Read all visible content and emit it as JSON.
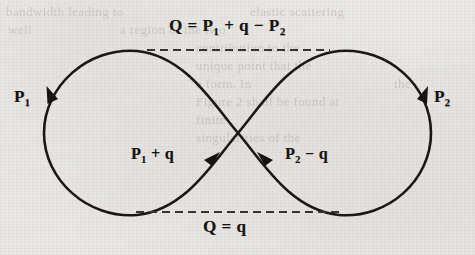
{
  "figure": {
    "kind": "figure-eight-momentum-diagram",
    "paper_color": "#edebe8",
    "ink_color": "#17130f",
    "dash_color": "#3a332c",
    "labels": {
      "top_equation": {
        "lead": "Q = P",
        "sub1": "1",
        "mid": " + q − P",
        "sub2": "2"
      },
      "bottom_equation": {
        "text": "Q = q"
      },
      "left_momentum": {
        "lead": "P",
        "sub": "1"
      },
      "right_momentum": {
        "lead": "P",
        "sub": "2"
      },
      "inner_left": {
        "lead": "P",
        "sub": "1",
        "tail": " + q"
      },
      "inner_right": {
        "lead": "P",
        "sub": "2",
        "tail": " − q"
      }
    },
    "ghost_text": [
      {
        "text": "bandwidth leading to",
        "x": 6,
        "y": 4
      },
      {
        "text": "elastic scattering",
        "x": 250,
        "y": 4
      },
      {
        "text": "well",
        "x": 8,
        "y": 22
      },
      {
        "text": "a region of the two",
        "x": 120,
        "y": 22
      },
      {
        "text": "contribution to the",
        "x": 196,
        "y": 40
      },
      {
        "text": "unique point that the",
        "x": 196,
        "y": 58
      },
      {
        "text": "a form. In",
        "x": 196,
        "y": 76
      },
      {
        "text": "the",
        "x": 394,
        "y": 76
      },
      {
        "text": "Figure 2 shall be found at",
        "x": 196,
        "y": 94
      },
      {
        "text": "finite",
        "x": 196,
        "y": 112
      },
      {
        "text": "singularities of the",
        "x": 196,
        "y": 130
      }
    ]
  },
  "chart_data": {
    "type": "diagram",
    "crossing_point": {
      "x": 238,
      "y": 133
    },
    "left_lobe": {
      "cx": 137,
      "cy": 133,
      "rx": 93,
      "ry": 83
    },
    "right_lobe": {
      "cx": 338,
      "cy": 133,
      "rx": 93,
      "ry": 83
    },
    "dashed_lines": [
      {
        "name": "top-cut",
        "x1": 147,
        "x2": 330,
        "y": 50,
        "label": "Q = P1 + q − P2"
      },
      {
        "name": "bottom-cut",
        "x1": 136,
        "x2": 344,
        "y": 212,
        "label": "Q = q"
      }
    ],
    "arrowheads": [
      {
        "name": "p1-arrow",
        "x": 51,
        "y": 97,
        "direction": "down",
        "label": "P1"
      },
      {
        "name": "p2-arrow",
        "x": 424,
        "y": 97,
        "direction": "down",
        "label": "P2"
      },
      {
        "name": "p1q-arrow",
        "x": 212,
        "y": 160,
        "direction": "up-right",
        "label": "P1 + q"
      },
      {
        "name": "p2q-arrow",
        "x": 265,
        "y": 160,
        "direction": "up-left",
        "label": "P2 − q"
      }
    ]
  }
}
